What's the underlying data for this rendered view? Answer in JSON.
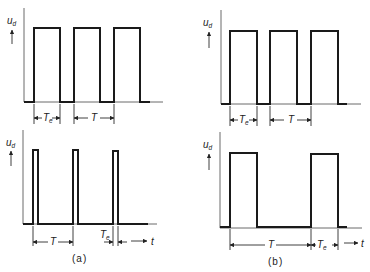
{
  "figure": {
    "panels": [
      {
        "id": "a-top",
        "y_label": "u",
        "y_label_sub": "d",
        "pulse_label": "T",
        "pulse_label_sub": "e",
        "period_label": "T"
      },
      {
        "id": "b-top",
        "y_label": "u",
        "y_label_sub": "d",
        "pulse_label": "T",
        "pulse_label_sub": "e",
        "period_label": "T"
      },
      {
        "id": "a-bottom",
        "y_label": "u",
        "y_label_sub": "d",
        "pulse_label": "T",
        "pulse_label_sub": "e",
        "period_label": "T",
        "time_label": "t"
      },
      {
        "id": "b-bottom",
        "y_label": "u",
        "y_label_sub": "d",
        "pulse_label": "T",
        "pulse_label_sub": "e",
        "period_label": "T",
        "time_label": "t"
      }
    ],
    "captions": {
      "a": "(a)",
      "b": "(b)"
    },
    "colors": {
      "line": "#1a1a1a",
      "axis": "#6a6a6a",
      "background": "#ffffff"
    }
  }
}
